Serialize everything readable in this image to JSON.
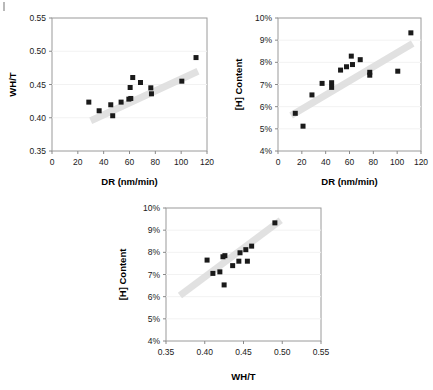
{
  "figure": {
    "background": "#ffffff",
    "marker_color": "#1a1a1a",
    "trendline_color": "#e0e0e0",
    "border_color": "#9a9a9a"
  },
  "chart_data": [
    {
      "id": "chart-wht-vs-dr",
      "type": "scatter",
      "title": "",
      "xlabel": "DR (nm/min)",
      "ylabel": "WH/T",
      "xlim": [
        0,
        120
      ],
      "ylim": [
        0.35,
        0.55
      ],
      "xticks": [
        0,
        20,
        40,
        60,
        80,
        100,
        120
      ],
      "yticks": [
        0.35,
        0.4,
        0.45,
        0.5,
        0.55
      ],
      "xtick_labels": [
        "0",
        "20",
        "40",
        "60",
        "80",
        "100",
        "120"
      ],
      "ytick_labels": [
        "0.35",
        "0.40",
        "0.45",
        "0.50",
        "0.55"
      ],
      "grid": true,
      "legend": "none",
      "points": [
        {
          "x": 28.5,
          "y": 0.4235
        },
        {
          "x": 36.5,
          "y": 0.4105
        },
        {
          "x": 45.5,
          "y": 0.4195
        },
        {
          "x": 47.0,
          "y": 0.403
        },
        {
          "x": 53.5,
          "y": 0.4235
        },
        {
          "x": 59.5,
          "y": 0.428
        },
        {
          "x": 61.0,
          "y": 0.429
        },
        {
          "x": 60.5,
          "y": 0.4455
        },
        {
          "x": 62.5,
          "y": 0.4605
        },
        {
          "x": 68.5,
          "y": 0.453
        },
        {
          "x": 76.5,
          "y": 0.445
        },
        {
          "x": 77.0,
          "y": 0.436
        },
        {
          "x": 100.5,
          "y": 0.455
        },
        {
          "x": 111.5,
          "y": 0.4905
        }
      ],
      "trendline": {
        "x1": 30,
        "y1": 0.3955,
        "x2": 113,
        "y2": 0.47
      }
    },
    {
      "id": "chart-hcontent-vs-dr",
      "type": "scatter",
      "title": "",
      "xlabel": "DR (nm/min)",
      "ylabel": "[H] Content",
      "xlim": [
        0,
        120
      ],
      "ylim": [
        4,
        10
      ],
      "xticks": [
        0,
        20,
        40,
        60,
        80,
        100,
        120
      ],
      "yticks": [
        4,
        5,
        6,
        7,
        8,
        9,
        10
      ],
      "xtick_labels": [
        "0",
        "20",
        "40",
        "60",
        "80",
        "100",
        "120"
      ],
      "ytick_labels": [
        "4%",
        "5%",
        "6%",
        "7%",
        "8%",
        "9%",
        "10%"
      ],
      "grid": true,
      "legend": "none",
      "points": [
        {
          "x": 14.5,
          "y": 5.7
        },
        {
          "x": 21.0,
          "y": 5.12
        },
        {
          "x": 28.5,
          "y": 6.53
        },
        {
          "x": 37.0,
          "y": 7.05
        },
        {
          "x": 45.0,
          "y": 7.08
        },
        {
          "x": 45.0,
          "y": 6.87
        },
        {
          "x": 52.5,
          "y": 7.65
        },
        {
          "x": 57.5,
          "y": 7.8
        },
        {
          "x": 61.5,
          "y": 8.28
        },
        {
          "x": 62.5,
          "y": 7.9
        },
        {
          "x": 69.0,
          "y": 8.12
        },
        {
          "x": 77.0,
          "y": 7.55
        },
        {
          "x": 77.0,
          "y": 7.42
        },
        {
          "x": 100.5,
          "y": 7.6
        },
        {
          "x": 111.5,
          "y": 9.33
        }
      ],
      "trendline": {
        "x1": 11,
        "y1": 5.6,
        "x2": 113,
        "y2": 8.85
      }
    },
    {
      "id": "chart-hcontent-vs-wht",
      "type": "scatter",
      "title": "",
      "xlabel": "WH/T",
      "ylabel": "[H] Content",
      "xlim": [
        0.35,
        0.55
      ],
      "ylim": [
        4,
        10
      ],
      "xticks": [
        0.35,
        0.4,
        0.45,
        0.5,
        0.55
      ],
      "yticks": [
        4,
        5,
        6,
        7,
        8,
        9,
        10
      ],
      "xtick_labels": [
        "0.35",
        "0.40",
        "0.45",
        "0.50",
        "0.55"
      ],
      "ytick_labels": [
        "4%",
        "5%",
        "6%",
        "7%",
        "8%",
        "9%",
        "10%"
      ],
      "grid": true,
      "legend": "none",
      "points": [
        {
          "x": 0.403,
          "y": 7.65
        },
        {
          "x": 0.4105,
          "y": 7.05
        },
        {
          "x": 0.4195,
          "y": 7.12
        },
        {
          "x": 0.4235,
          "y": 7.8
        },
        {
          "x": 0.426,
          "y": 7.85
        },
        {
          "x": 0.425,
          "y": 6.53
        },
        {
          "x": 0.436,
          "y": 7.4
        },
        {
          "x": 0.444,
          "y": 7.6
        },
        {
          "x": 0.4455,
          "y": 7.98
        },
        {
          "x": 0.453,
          "y": 8.12
        },
        {
          "x": 0.455,
          "y": 7.6
        },
        {
          "x": 0.4605,
          "y": 8.28
        },
        {
          "x": 0.4905,
          "y": 9.33
        }
      ],
      "trendline": {
        "x1": 0.368,
        "y1": 6.05,
        "x2": 0.498,
        "y2": 9.45
      }
    }
  ]
}
